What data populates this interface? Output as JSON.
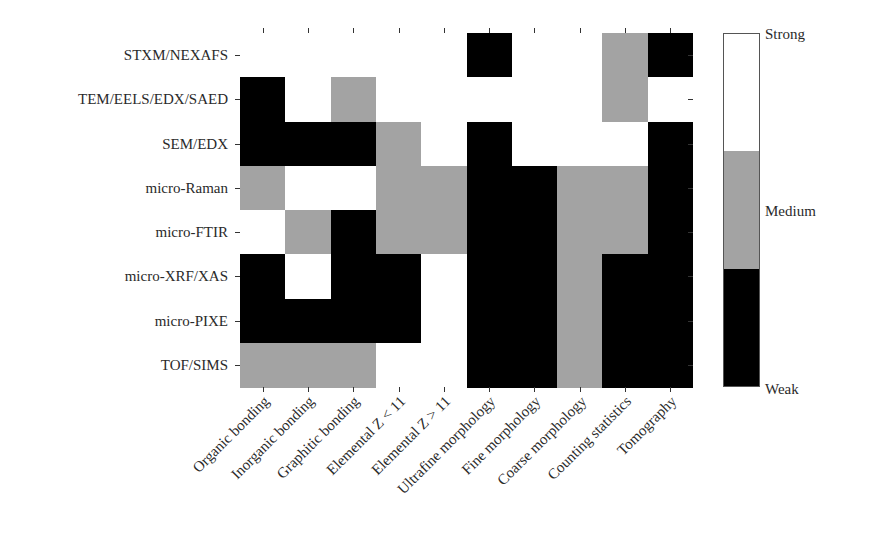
{
  "chart_data": {
    "type": "heatmap",
    "title": "",
    "xlabel": "",
    "ylabel": "",
    "rows": [
      "STXM/NEXAFS",
      "TEM/EELS/EDX/SAED",
      "SEM/EDX",
      "micro-Raman",
      "micro-FTIR",
      "micro-XRF/XAS",
      "micro-PIXE",
      "TOF/SIMS"
    ],
    "columns": [
      "Organic bonding",
      "Inorganic bonding",
      "Graphitic bonding",
      "Elemental Z < 11",
      "Elemental Z > 11",
      "Ultrafine morphology",
      "Fine morphology",
      "Coarse morphology",
      "Counting statistics",
      "Tomography"
    ],
    "scale": [
      "Weak",
      "Medium",
      "Strong"
    ],
    "values": [
      [
        "Strong",
        "Strong",
        "Strong",
        "Strong",
        "Strong",
        "Weak",
        "Strong",
        "Strong",
        "Medium",
        "Weak"
      ],
      [
        "Weak",
        "Strong",
        "Medium",
        "Strong",
        "Strong",
        "Strong",
        "Strong",
        "Strong",
        "Medium",
        "Strong"
      ],
      [
        "Weak",
        "Weak",
        "Weak",
        "Medium",
        "Strong",
        "Weak",
        "Strong",
        "Strong",
        "Strong",
        "Weak"
      ],
      [
        "Medium",
        "Strong",
        "Strong",
        "Medium",
        "Medium",
        "Weak",
        "Weak",
        "Medium",
        "Medium",
        "Weak"
      ],
      [
        "Strong",
        "Medium",
        "Weak",
        "Medium",
        "Medium",
        "Weak",
        "Weak",
        "Medium",
        "Medium",
        "Weak"
      ],
      [
        "Weak",
        "Strong",
        "Weak",
        "Weak",
        "Strong",
        "Weak",
        "Weak",
        "Medium",
        "Weak",
        "Weak"
      ],
      [
        "Weak",
        "Weak",
        "Weak",
        "Weak",
        "Strong",
        "Weak",
        "Weak",
        "Medium",
        "Weak",
        "Weak"
      ],
      [
        "Medium",
        "Medium",
        "Medium",
        "Strong",
        "Strong",
        "Weak",
        "Weak",
        "Medium",
        "Weak",
        "Weak"
      ]
    ],
    "colors": {
      "Strong": "#ffffff",
      "Medium": "#a3a3a3",
      "Weak": "#000000"
    },
    "colorbar": {
      "labels": {
        "top": "Strong",
        "middle": "Medium",
        "bottom": "Weak"
      }
    },
    "grid": false,
    "legend_position": "right"
  }
}
